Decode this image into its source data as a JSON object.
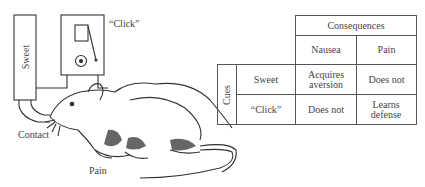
{
  "illustration": {
    "sweet_label": "Sweet",
    "click_label": "“Click”",
    "contact_label": "Contact",
    "pain_label": "Pain"
  },
  "table": {
    "header": "Consequences",
    "row_group_label": "Cues",
    "columns": [
      "Nausea",
      "Pain"
    ],
    "rows": [
      {
        "cue": "Sweet",
        "cells": [
          "Acquires aversion",
          "Does not"
        ]
      },
      {
        "cue": "“Click”",
        "cells": [
          "Does not",
          "Learns defense"
        ]
      }
    ]
  },
  "colors": {
    "ink": "#444444",
    "background": "#ffffff"
  }
}
